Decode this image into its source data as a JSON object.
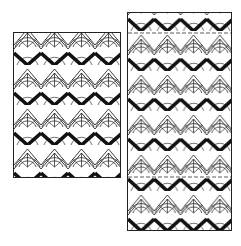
{
  "figure": {
    "colors": {
      "ink": "#111111",
      "paper": "#ffffff",
      "frame": "#222222"
    },
    "panels": [
      {
        "id": "left",
        "columns": 4,
        "zigzag_rows": 3,
        "tile_width": 27,
        "tile_height": 40,
        "dashed_lines": 0
      },
      {
        "id": "right",
        "columns": 4,
        "zigzag_rows": 6,
        "tile_width": 26.25,
        "tile_height": 40,
        "dashed_lines": 2
      }
    ]
  }
}
